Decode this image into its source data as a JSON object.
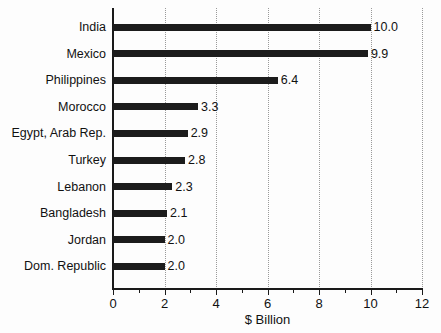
{
  "chart_data": {
    "type": "bar",
    "orientation": "horizontal",
    "title": "",
    "xlabel": "$ Billion",
    "ylabel": "",
    "xlim": [
      0,
      12
    ],
    "xticks": [
      0,
      2,
      4,
      6,
      8,
      10,
      12
    ],
    "xtick_labels": [
      "0",
      "2",
      "4",
      "6",
      "8",
      "10",
      "12"
    ],
    "minor_xticks": [
      1,
      3,
      5,
      7,
      9,
      11
    ],
    "grid": "vertical-dotted",
    "legend": "none",
    "categories": [
      "India",
      "Mexico",
      "Philippines",
      "Morocco",
      "Egypt, Arab Rep.",
      "Turkey",
      "Lebanon",
      "Bangladesh",
      "Jordan",
      "Dom. Republic"
    ],
    "values": [
      10.0,
      9.9,
      6.4,
      3.3,
      2.9,
      2.8,
      2.3,
      2.1,
      2.0,
      2.0
    ],
    "data_labels": [
      "10.0",
      "9.9",
      "6.4",
      "3.3",
      "2.9",
      "2.8",
      "2.3",
      "2.1",
      "2.0",
      "2.0"
    ],
    "bar_color": "#1c1c1c",
    "axis_color": "#1a1a1a",
    "grid_color": "#9a9a9a",
    "background_color": "#fdfdfd"
  }
}
